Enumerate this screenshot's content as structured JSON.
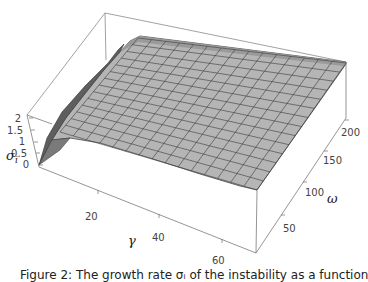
{
  "chart_data": {
    "type": "surface3d",
    "title": "",
    "xlabel": "γ",
    "ylabel": "ω",
    "zlabel": "σ_i",
    "x_ticks": [
      "20",
      "40",
      "60"
    ],
    "y_ticks": [
      "50",
      "100",
      "150",
      "200"
    ],
    "z_ticks": [
      "0",
      "0.5",
      "1",
      "1.5",
      "2"
    ],
    "x_range": [
      0,
      70
    ],
    "y_range": [
      0,
      210
    ],
    "z_range": [
      0,
      2.2
    ],
    "profile_along_gamma": {
      "gamma": [
        0,
        5,
        10,
        15,
        20,
        30,
        40,
        50,
        60,
        70
      ],
      "sigma_i": [
        0.3,
        1.5,
        1.95,
        2.0,
        1.95,
        1.85,
        1.7,
        1.6,
        1.45,
        1.3
      ]
    },
    "mesh": "grid with dark mesh lines, gray shaded faces",
    "box": true,
    "colors": {
      "surface": "#b4b4b4",
      "surface_dark": "#6e6e6e",
      "mesh": "#333333",
      "box": "#888888"
    }
  },
  "labels": {
    "x_axis": "γ",
    "y_axis": "ω",
    "z_axis_main": "σ",
    "z_axis_sub": "i",
    "x_ticks": [
      "20",
      "40",
      "60"
    ],
    "y_ticks": [
      "50",
      "100",
      "150",
      "200"
    ],
    "z_ticks": [
      "0",
      "0.5",
      "1",
      "1.5",
      "2"
    ]
  },
  "caption": "Figure 2: The growth rate σᵢ of the instability as a function of γ and ω in the Optical"
}
